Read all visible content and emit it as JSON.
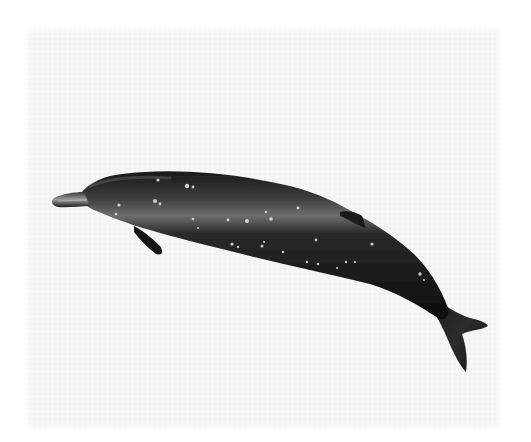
{
  "image": {
    "subject": "beaked whale illustration",
    "background_color": "#ffffff",
    "panel_color": "#f7f7f7"
  },
  "whale": {
    "body_color_dark": "#0e0e0e",
    "body_color_mid": "#2a2a2a",
    "highlight_color": "#8a8a8a",
    "spot_color": "#e6e6e6",
    "spots": [
      {
        "x": 158,
        "y": 180,
        "r": 1.6
      },
      {
        "x": 187,
        "y": 186,
        "r": 2.2
      },
      {
        "x": 193,
        "y": 187,
        "r": 1.4
      },
      {
        "x": 155,
        "y": 201,
        "r": 2.0
      },
      {
        "x": 160,
        "y": 204,
        "r": 1.4
      },
      {
        "x": 119,
        "y": 205,
        "r": 1.6
      },
      {
        "x": 116,
        "y": 214,
        "r": 1.3
      },
      {
        "x": 193,
        "y": 219,
        "r": 1.3
      },
      {
        "x": 198,
        "y": 228,
        "r": 1.1
      },
      {
        "x": 228,
        "y": 220,
        "r": 1.4
      },
      {
        "x": 247,
        "y": 221,
        "r": 2.0
      },
      {
        "x": 271,
        "y": 219,
        "r": 1.8
      },
      {
        "x": 266,
        "y": 212,
        "r": 1.2
      },
      {
        "x": 298,
        "y": 208,
        "r": 1.4
      },
      {
        "x": 232,
        "y": 244,
        "r": 1.6
      },
      {
        "x": 238,
        "y": 247,
        "r": 1.2
      },
      {
        "x": 262,
        "y": 246,
        "r": 1.5
      },
      {
        "x": 264,
        "y": 242,
        "r": 1.1
      },
      {
        "x": 283,
        "y": 252,
        "r": 1.2
      },
      {
        "x": 316,
        "y": 240,
        "r": 1.4
      },
      {
        "x": 372,
        "y": 244,
        "r": 1.6
      },
      {
        "x": 307,
        "y": 262,
        "r": 1.2
      },
      {
        "x": 318,
        "y": 264,
        "r": 1.3
      },
      {
        "x": 337,
        "y": 268,
        "r": 1.0
      },
      {
        "x": 346,
        "y": 262,
        "r": 1.2
      },
      {
        "x": 355,
        "y": 262,
        "r": 1.1
      },
      {
        "x": 420,
        "y": 274,
        "r": 1.7
      },
      {
        "x": 424,
        "y": 280,
        "r": 1.0
      }
    ]
  }
}
